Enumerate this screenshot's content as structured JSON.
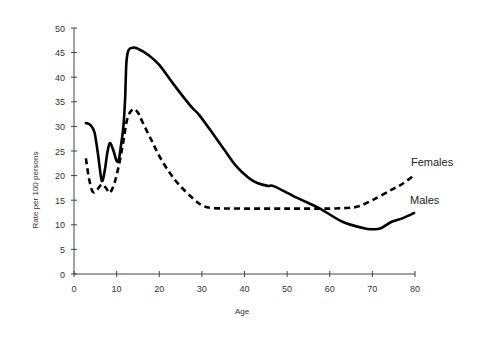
{
  "chart_data": {
    "type": "line",
    "title": "",
    "xlabel": "Age",
    "ylabel": "Rate per 100 persons",
    "xlim": [
      0,
      80
    ],
    "ylim": [
      0,
      50
    ],
    "xticks": [
      0,
      10,
      20,
      30,
      40,
      50,
      60,
      70,
      80
    ],
    "yticks": [
      0,
      5,
      10,
      15,
      20,
      25,
      30,
      35,
      40,
      45,
      50
    ],
    "grid": false,
    "legend_position": "inline-right",
    "series": [
      {
        "name": "Males",
        "style": "solid",
        "color": "#000000",
        "label_pos": [
          77.5,
          14.5
        ],
        "points": [
          [
            2.8,
            30.7
          ],
          [
            3.8,
            30.3
          ],
          [
            4.8,
            28.8
          ],
          [
            5.6,
            24.5
          ],
          [
            6.5,
            19.0
          ],
          [
            7.2,
            21.0
          ],
          [
            7.8,
            24.5
          ],
          [
            8.4,
            26.6
          ],
          [
            9.2,
            25.2
          ],
          [
            10.0,
            23.0
          ],
          [
            10.5,
            23.2
          ],
          [
            11.0,
            26.0
          ],
          [
            11.6,
            30.0
          ],
          [
            12.0,
            36.0
          ],
          [
            12.3,
            43.0
          ],
          [
            12.8,
            45.5
          ],
          [
            13.8,
            46.0
          ],
          [
            15.0,
            45.8
          ],
          [
            17.5,
            44.5
          ],
          [
            20.0,
            42.5
          ],
          [
            23.5,
            38.4
          ],
          [
            27.5,
            34.0
          ],
          [
            29.4,
            32.3
          ],
          [
            33.0,
            28.0
          ],
          [
            35.3,
            25.2
          ],
          [
            38.0,
            22.0
          ],
          [
            41.0,
            19.5
          ],
          [
            43.0,
            18.5
          ],
          [
            45.5,
            17.9
          ],
          [
            47.0,
            17.8
          ],
          [
            52.5,
            15.4
          ],
          [
            57.5,
            13.4
          ],
          [
            63.0,
            10.6
          ],
          [
            68.0,
            9.3
          ],
          [
            70.0,
            9.1
          ],
          [
            72.0,
            9.3
          ],
          [
            74.5,
            10.6
          ],
          [
            77.0,
            11.3
          ],
          [
            79.8,
            12.4
          ]
        ]
      },
      {
        "name": "Females",
        "style": "dashed",
        "color": "#000000",
        "label_pos": [
          78.0,
          22.3
        ],
        "points": [
          [
            2.8,
            23.5
          ],
          [
            3.5,
            19.5
          ],
          [
            4.4,
            16.7
          ],
          [
            5.5,
            17.2
          ],
          [
            6.5,
            18.2
          ],
          [
            7.5,
            17.5
          ],
          [
            8.4,
            16.5
          ],
          [
            9.5,
            18.5
          ],
          [
            10.5,
            22.0
          ],
          [
            11.5,
            26.5
          ],
          [
            12.5,
            31.5
          ],
          [
            13.8,
            33.5
          ],
          [
            15.0,
            32.8
          ],
          [
            16.0,
            31.0
          ],
          [
            18.0,
            27.5
          ],
          [
            20.0,
            24.0
          ],
          [
            22.5,
            20.5
          ],
          [
            25.0,
            17.8
          ],
          [
            28.0,
            15.3
          ],
          [
            30.0,
            14.0
          ],
          [
            32.5,
            13.4
          ],
          [
            40.0,
            13.3
          ],
          [
            50.0,
            13.3
          ],
          [
            60.0,
            13.3
          ],
          [
            65.0,
            13.5
          ],
          [
            67.0,
            13.8
          ],
          [
            70.0,
            15.0
          ],
          [
            74.0,
            16.9
          ],
          [
            77.0,
            18.3
          ],
          [
            79.8,
            20.1
          ]
        ]
      }
    ]
  },
  "axes": {
    "x_title": "Age",
    "y_title": "Rate per 100 persons"
  },
  "legend": {
    "females_label": "Females",
    "males_label": "Males"
  }
}
